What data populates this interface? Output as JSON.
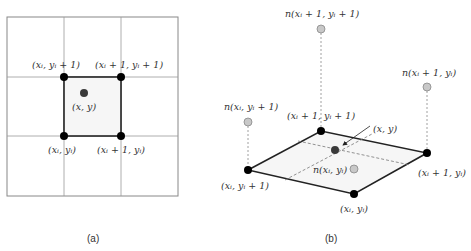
{
  "panel_a": {
    "caption": "(a)",
    "labels": {
      "top_left": "(xᵢ, yᵢ + 1)",
      "top_right": "(xᵢ + 1, yᵢ + 1)",
      "center": "(x, y)",
      "bottom_left": "(xᵢ, yᵢ)",
      "bottom_right": "(xᵢ + 1, yᵢ)"
    }
  },
  "panel_b": {
    "caption": "(b)",
    "labels": {
      "n_top": "n(xᵢ + 1, yᵢ + 1)",
      "n_right": "n(xᵢ + 1, yᵢ)",
      "n_left": "n(xᵢ, yᵢ + 1)",
      "n_center": "n(xᵢ, yᵢ)",
      "top_corner": "(xᵢ + 1, yᵢ + 1)",
      "point": "(x, y)",
      "left_corner": "(xᵢ, yᵢ + 1)",
      "right_corner": "(xᵢ + 1, yᵢ)",
      "bottom_corner": "(xᵢ, yᵢ)"
    }
  },
  "colors": {
    "grid": "#888888",
    "edge": "#111111",
    "node": "#000000",
    "point": "#3a3a3a",
    "gray_node": "#c8c8c8",
    "fill": "#f6f6f6"
  }
}
